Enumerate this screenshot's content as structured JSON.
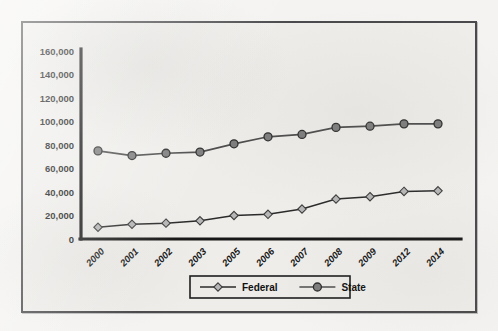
{
  "chart_data": {
    "type": "line",
    "title": "",
    "xlabel": "",
    "ylabel": "",
    "ylim": [
      0,
      160000
    ],
    "grid": false,
    "legend_position": "bottom",
    "categories": [
      "2000",
      "2001",
      "2002",
      "2003",
      "2005",
      "2006",
      "2007",
      "2008",
      "2009",
      "2012",
      "2014"
    ],
    "ytick_labels": [
      "160,000",
      "140,000",
      "120,000",
      "100,000",
      "80,000",
      "60,000",
      "40,000",
      "20,000",
      "0"
    ],
    "ytick_values": [
      160000,
      140000,
      120000,
      100000,
      80000,
      60000,
      40000,
      20000,
      0
    ],
    "series": [
      {
        "name": "Federal",
        "marker": "diamond",
        "values": [
          10000,
          12500,
          13500,
          15500,
          20000,
          21000,
          25500,
          34000,
          36000,
          40500,
          41000
        ]
      },
      {
        "name": "State",
        "marker": "circle",
        "values": [
          75000,
          71000,
          73000,
          74000,
          81000,
          87000,
          89000,
          95000,
          96000,
          98000,
          98000
        ]
      }
    ]
  },
  "legend": {
    "items": [
      {
        "label": "Federal",
        "marker": "diamond"
      },
      {
        "label": "State",
        "marker": "circle"
      }
    ]
  },
  "colors": {
    "frame_border": "#4a4a4c",
    "plot_background": "#eeedea",
    "page_background": "#f4f3f1",
    "axis": "#171717",
    "federal_line": "#2b2b2b",
    "federal_marker": "#b6b6b6",
    "state_line": "#4c4c4c",
    "state_marker": "#7d7d7d"
  }
}
